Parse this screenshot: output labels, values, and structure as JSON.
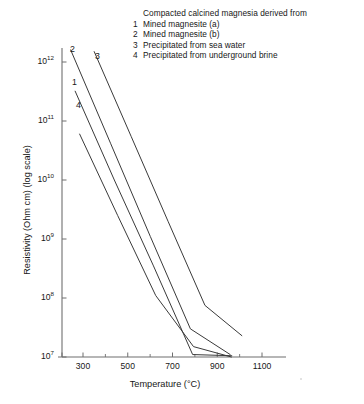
{
  "chart_data": {
    "type": "line",
    "title": "",
    "xlabel": "Temperature (°C)",
    "ylabel": "Resistivity (Ohm cm) (log scale)",
    "xlim": [
      200,
      1200
    ],
    "ylim": [
      10000000.0,
      3000000000000.0
    ],
    "yscale": "log",
    "grid": false,
    "legend_position": "top-right",
    "legend_title": "Compacted calcined magnesia derived from",
    "xticks": [
      300,
      500,
      700,
      900,
      1100
    ],
    "xtick_labels": [
      "300",
      "500",
      "700",
      "900",
      "1100"
    ],
    "xminor_ticks": [
      400,
      600,
      800,
      1000
    ],
    "yticks": [
      10000000.0,
      100000000.0,
      1000000000.0,
      10000000000.0,
      100000000000.0,
      1000000000000.0
    ],
    "ytick_labels": [
      "10⁷",
      "10⁸",
      "10⁹",
      "10¹⁰",
      "10¹¹",
      "10¹²"
    ],
    "ytick_mantissa": [
      "10",
      "10",
      "10",
      "10",
      "10",
      "10"
    ],
    "ytick_exponent": [
      "7",
      "8",
      "9",
      "10",
      "11",
      "12"
    ],
    "series": [
      {
        "name": "1",
        "label": "Mined magnesite (a)",
        "color": "#3a3a3a",
        "x": [
          265,
          965
        ],
        "y": [
          320000000000.0,
          10500000.0
        ],
        "points": [
          {
            "x": 265,
            "y": 320000000000.0
          },
          {
            "x": 440,
            "y": 10000000000.0
          },
          {
            "x": 615,
            "y": 350000000.0
          },
          {
            "x": 790,
            "y": 11000000.0
          },
          {
            "x": 965,
            "y": 10500000.0
          }
        ]
      },
      {
        "name": "2",
        "label": "Mined magnesite (b)",
        "color": "#3a3a3a",
        "x": [
          245,
          958
        ],
        "y": [
          1600000000000.0,
          11000000.0
        ],
        "points": [
          {
            "x": 245,
            "y": 1600000000000.0
          },
          {
            "x": 423,
            "y": 42000000000.0
          },
          {
            "x": 601,
            "y": 1100000000.0
          },
          {
            "x": 780,
            "y": 30000000.0
          },
          {
            "x": 958,
            "y": 11000000.0
          }
        ]
      },
      {
        "name": "3",
        "label": "Precipitated from sea water",
        "color": "#3a3a3a",
        "x": [
          350,
          1010
        ],
        "y": [
          1500000000000.0,
          23000000.0
        ],
        "points": [
          {
            "x": 350,
            "y": 1500000000000.0
          },
          {
            "x": 515,
            "y": 55000000000.0
          },
          {
            "x": 680,
            "y": 2000000000.0
          },
          {
            "x": 845,
            "y": 75000000.0
          },
          {
            "x": 1010,
            "y": 23000000.0
          }
        ]
      },
      {
        "name": "4",
        "label": "Precipitated from underground brine",
        "color": "#3a3a3a",
        "x": [
          285,
          963
        ],
        "y": [
          60000000000.0,
          10000000.0
        ],
        "points": [
          {
            "x": 285,
            "y": 60000000000.0
          },
          {
            "x": 455,
            "y": 2500000000.0
          },
          {
            "x": 625,
            "y": 110000000.0
          },
          {
            "x": 794,
            "y": 15000000.0
          },
          {
            "x": 963,
            "y": 10000000.0
          }
        ]
      }
    ],
    "curve_labels": [
      {
        "name": "2",
        "x_px": 70,
        "y_px": 44
      },
      {
        "name": "3",
        "x_px": 95,
        "y_px": 51
      },
      {
        "name": "1",
        "x_px": 72,
        "y_px": 77
      },
      {
        "name": "4",
        "x_px": 76,
        "y_px": 100
      }
    ]
  },
  "legend": {
    "title": "Compacted calcined magnesia derived from",
    "items": [
      {
        "num": "1",
        "text": "Mined magnesite (a)"
      },
      {
        "num": "2",
        "text": "Mined magnesite (b)"
      },
      {
        "num": "3",
        "text": "Precipitated from sea water"
      },
      {
        "num": "4",
        "text": "Precipitated from underground brine"
      }
    ]
  },
  "axes": {
    "x_title": "Temperature (°C)",
    "y_title": "Resistivity (Ohm cm) (log scale)",
    "x_ticks": [
      "300",
      "500",
      "700",
      "900",
      "1100"
    ],
    "y_ticks": [
      {
        "mantissa": "10",
        "exp": "12"
      },
      {
        "mantissa": "10",
        "exp": "11"
      },
      {
        "mantissa": "10",
        "exp": "10"
      },
      {
        "mantissa": "10",
        "exp": "9"
      },
      {
        "mantissa": "10",
        "exp": "8"
      },
      {
        "mantissa": "10",
        "exp": "7"
      }
    ]
  },
  "colors": {
    "axis": "#6f6f6f",
    "curve": "#3a3a3a",
    "text": "#171717",
    "background": "#ffffff"
  }
}
